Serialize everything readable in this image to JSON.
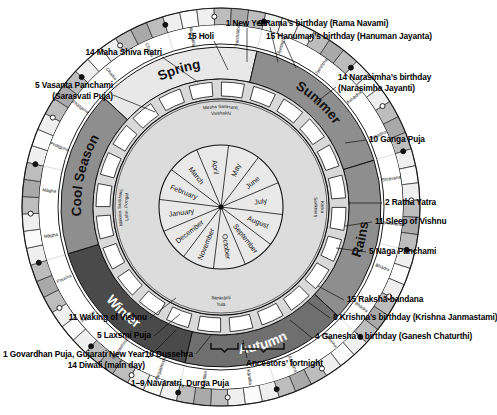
{
  "center_wheel": {
    "name": "gregorian-months",
    "months": [
      "January",
      "February",
      "March",
      "April",
      "May",
      "June",
      "July",
      "August",
      "September",
      "October",
      "November",
      "December"
    ]
  },
  "sankranti_ring": {
    "name": "solar-sankranti-ring",
    "labels": [
      {
        "text": "Mesha Sankranti, Vaishakhi",
        "angle": 0,
        "lines": [
          "Mesha Sankranti,",
          "Vaishakhi"
        ]
      },
      {
        "text": "Karka Sankranti",
        "angle": 90,
        "lines": [
          "Karka",
          "Sankranti"
        ]
      },
      {
        "text": "Tula Sankranti",
        "angle": 180,
        "lines": [
          "Tulā",
          "Sankrānti"
        ]
      },
      {
        "text": "Makara Sankranti, Lohri, Pongal",
        "angle": 270,
        "lines": [
          "Makara Sankranti,",
          "Lohri, Pongal"
        ]
      }
    ]
  },
  "seasons_ring": {
    "name": "seasons-ring",
    "seasons": [
      {
        "label": "Spring",
        "start_deg": -60,
        "end_deg": 0,
        "fill": "#e8e8e8"
      },
      {
        "label": "Summer",
        "start_deg": 0,
        "end_deg": 60,
        "fill": "#8e8e8e"
      },
      {
        "label": "Rains",
        "start_deg": 60,
        "end_deg": 120,
        "fill": "#8e8e8e"
      },
      {
        "label": "Autumn",
        "start_deg": 120,
        "end_deg": 180,
        "fill": "#6f6f6f"
      },
      {
        "label": "Winter",
        "start_deg": 180,
        "end_deg": 240,
        "fill": "#4a4a4a"
      },
      {
        "label": "Cool Season",
        "start_deg": 240,
        "end_deg": 300,
        "fill": "#8e8e8e"
      }
    ]
  },
  "lunar_month_ring": {
    "name": "lunar-month-ring",
    "months": [
      "Chaitra",
      "Vaishākha",
      "Jyeshtha",
      "Āshādha",
      "Shrāvana",
      "Bhādra",
      "Āshwina",
      "Kārttika",
      "Mārgashirsha",
      "Pausha",
      "Māgha",
      "Phālguna"
    ]
  },
  "day_ring": {
    "name": "fortnight-day-ring",
    "fortnights_per_month": 2,
    "cells_per_fortnight": 3,
    "moon_markers": {
      "new_moon": "●",
      "full_moon": "○"
    },
    "note": "alternating light and dark fortnight cells with new-moon and full-moon markers"
  },
  "brackets": [
    {
      "name": "navaratri-bracket",
      "label": "1–9 Navaratri, Durga Puja"
    },
    {
      "name": "ancestors-bracket",
      "label": "Ancestors' fortnight"
    }
  ],
  "callouts": [
    {
      "id": "new-year",
      "text": "1 New Year",
      "align": "center"
    },
    {
      "id": "holi",
      "text": "15 Holi",
      "align": "right"
    },
    {
      "id": "maha-shiva-ratri",
      "text": "14 Maha Shiva Ratri",
      "align": "right"
    },
    {
      "id": "vasanta-panchami",
      "text": "5 Vasanta Panchami",
      "align": "right",
      "line2": "(Sarasvati Puja)"
    },
    {
      "id": "rama-navami",
      "text": "9 Rama’s birthday (Rama Navami)",
      "align": "left"
    },
    {
      "id": "hanuman-jayanta",
      "text": "15 Hanuman’s birthday (Hanuman Jayanta)",
      "align": "left"
    },
    {
      "id": "narasimha-jayanti",
      "text": "14 Narasimha’s birthday",
      "align": "left",
      "line2": "(Narasimha Jayanti)"
    },
    {
      "id": "ganga-puja",
      "text": "10 Ganga Puja",
      "align": "left"
    },
    {
      "id": "ratha-yatra",
      "text": "2 Ratha Yatra",
      "align": "left"
    },
    {
      "id": "sleep-of-vishnu",
      "text": "11 Sleep of Vishnu",
      "align": "left"
    },
    {
      "id": "naga-panchami",
      "text": "5 Nāga Panchami",
      "align": "left"
    },
    {
      "id": "raksha-bandana",
      "text": "15 Rakshā-bandana",
      "align": "left"
    },
    {
      "id": "krishna-janmastami",
      "text": "8 Krishna’s birthday (Krishna Janmastami)",
      "align": "left"
    },
    {
      "id": "ganesh-chaturthi",
      "text": "4 Ganesha’s birthday (Ganesh Chaturthi)",
      "align": "left"
    },
    {
      "id": "ancestors-fortnight",
      "text": "Ancestors’ fortnight",
      "align": "left"
    },
    {
      "id": "navaratri",
      "text": "1–9 Navaratri, Durga Puja",
      "align": "left"
    },
    {
      "id": "dussehra",
      "text": "10 Dussehra",
      "align": "right"
    },
    {
      "id": "diwali",
      "text": "1 Govardhan Puja, Gujarati New Year",
      "align": "right",
      "line2": "14 Diwali (main day)"
    },
    {
      "id": "laxsmi-puja",
      "text": "5 Laxsmi Puja",
      "align": "right"
    },
    {
      "id": "waking-of-vishnu",
      "text": "11 Waking of Vishnu",
      "align": "right"
    }
  ]
}
